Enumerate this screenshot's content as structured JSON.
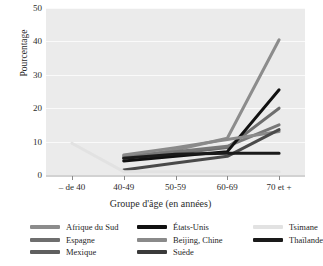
{
  "chart_data": {
    "type": "line",
    "title": "",
    "xlabel": "Groupe d'âge (en années)",
    "ylabel": "Pourcentage",
    "categories": [
      "– de 40",
      "40-49",
      "50-59",
      "60-69",
      "70 et +"
    ],
    "ylim": [
      0,
      50
    ],
    "yticks": [
      0,
      10,
      20,
      30,
      40,
      50
    ],
    "grid": true,
    "legend_position": "bottom",
    "legend_columns": 3,
    "series": [
      {
        "name": "Afrique du Sud",
        "color": "#8c8c8c",
        "values": [
          null,
          5.0,
          7.5,
          11.0,
          40.5
        ]
      },
      {
        "name": "Espagne",
        "color": "#6e6e6e",
        "values": [
          null,
          5.2,
          6.4,
          8.2,
          20.0
        ]
      },
      {
        "name": "Mexique",
        "color": "#787878",
        "values": [
          null,
          5.6,
          7.0,
          8.6,
          15.0
        ]
      },
      {
        "name": "États-Unis",
        "color": "#111111",
        "values": [
          null,
          4.2,
          5.6,
          7.0,
          25.5
        ]
      },
      {
        "name": "Beijing, Chine",
        "color": "#8a8a8a",
        "values": [
          null,
          6.0,
          8.2,
          10.6,
          13.0
        ]
      },
      {
        "name": "Suède",
        "color": "#4a4a4a",
        "values": [
          null,
          1.5,
          3.6,
          5.6,
          13.6
        ]
      },
      {
        "name": "Tsimane",
        "color": "#e2e2e2",
        "values": [
          9.5,
          1.0,
          1.0,
          1.0,
          1.0
        ]
      },
      {
        "name": "Thaïlande",
        "color": "#1a1a1a",
        "values": [
          null,
          5.0,
          6.2,
          6.5,
          6.5
        ]
      }
    ]
  },
  "legend": {
    "columns": [
      [
        {
          "label": "Afrique du Sud",
          "color": "#8c8c8c"
        },
        {
          "label": "Espagne",
          "color": "#6e6e6e"
        },
        {
          "label": "Mexique",
          "color": "#5f5f5f"
        }
      ],
      [
        {
          "label": "États-Unis",
          "color": "#111111"
        },
        {
          "label": "Beijing, Chine",
          "color": "#8a8a8a"
        },
        {
          "label": "Suède",
          "color": "#3a3a3a"
        }
      ],
      [
        {
          "label": "Tsimane",
          "color": "#e2e2e2"
        },
        {
          "label": "Thaïlande",
          "color": "#1a1a1a"
        }
      ]
    ]
  }
}
